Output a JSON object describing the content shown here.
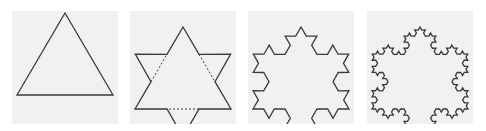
{
  "figure": {
    "stroke_color": "#3a3a3a",
    "panel_bg": "#f1f1f1",
    "panels": [
      {
        "iteration": 0,
        "label": "triangle",
        "left": 12
      },
      {
        "iteration": 1,
        "label": "star of david",
        "left": 130
      },
      {
        "iteration": 2,
        "label": "second iteration",
        "left": 248
      },
      {
        "iteration": 3,
        "label": "third iteration",
        "left": 367
      }
    ]
  }
}
